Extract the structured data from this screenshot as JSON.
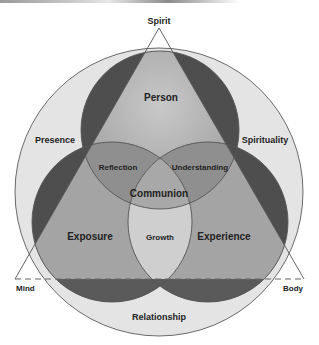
{
  "diagram": {
    "vertices": {
      "top": "Spirit",
      "left": "Mind",
      "right": "Body"
    },
    "outer_ring": {
      "left": "Presence",
      "right": "Spirituality",
      "bottom": "Relationship"
    },
    "circles": {
      "top": "Person",
      "left": "Exposure",
      "right": "Experience"
    },
    "overlaps": {
      "top_left": "Reflection",
      "top_right": "Understanding",
      "center": "Communion",
      "bottom": "Growth"
    },
    "colors": {
      "outer_circle": "#e4e4e4",
      "circle_dark": "#4e4e4e",
      "triangle_fill": "#a4a4a4",
      "overlap_fill": "#8f8f8f",
      "growth_fill": "#cfcfcf",
      "stroke": "#555555"
    }
  }
}
